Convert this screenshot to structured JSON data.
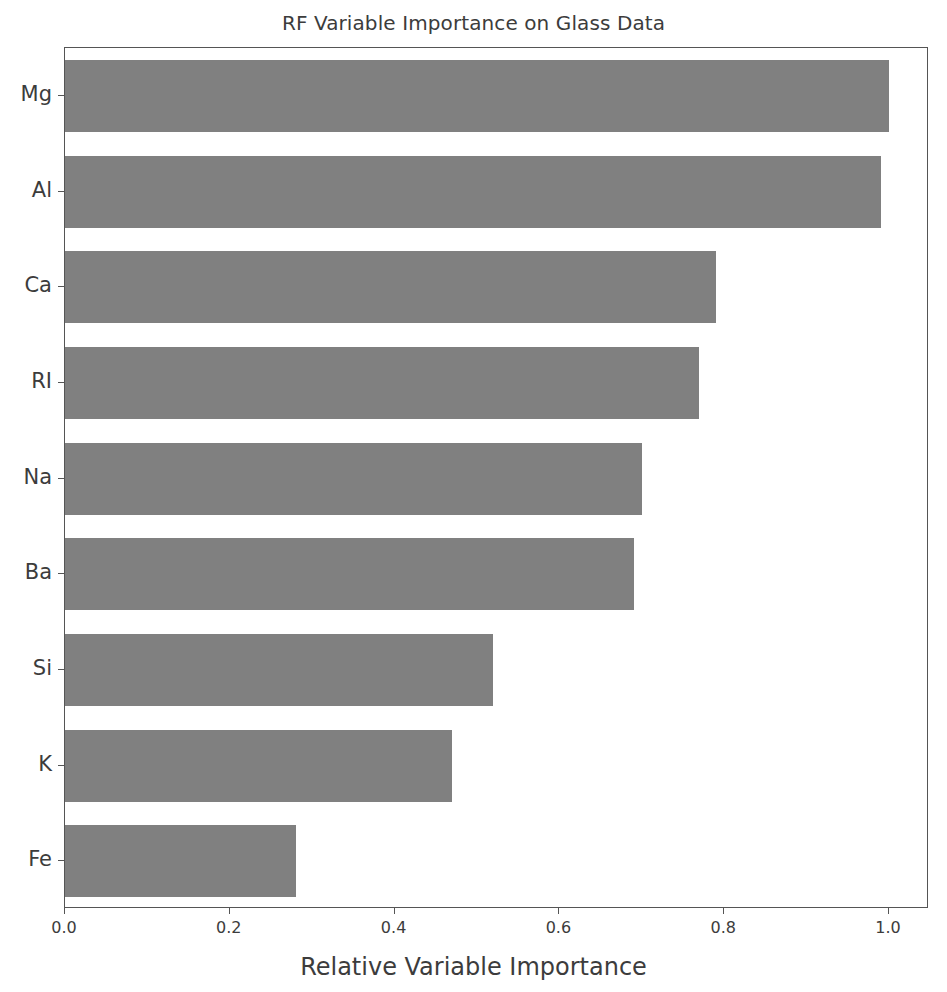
{
  "chart_data": {
    "type": "bar",
    "orientation": "horizontal",
    "title": "RF Variable Importance on Glass Data",
    "xlabel": "Relative Variable Importance",
    "ylabel": "",
    "categories": [
      "Mg",
      "Al",
      "Ca",
      "RI",
      "Na",
      "Ba",
      "Si",
      "K",
      "Fe"
    ],
    "values": [
      1.0,
      0.99,
      0.79,
      0.77,
      0.7,
      0.69,
      0.52,
      0.47,
      0.28
    ],
    "xlim": [
      0.0,
      1.05
    ],
    "xticks": [
      0.0,
      0.2,
      0.4,
      0.6,
      0.8,
      1.0
    ],
    "xticklabels": [
      "0.0",
      "0.2",
      "0.4",
      "0.6",
      "0.8",
      "1.0"
    ],
    "grid": false,
    "legend": false,
    "bar_color": "#808080",
    "axis_color": "#555555",
    "text_color": "#3c3c3c",
    "background_color": "#ffffff"
  }
}
